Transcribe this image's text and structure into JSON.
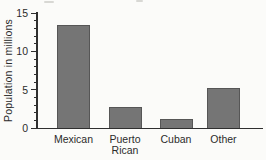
{
  "chart_data": {
    "type": "bar",
    "title": "",
    "categories": [
      "Mexican",
      "Puerto Rican",
      "Cuban",
      "Other"
    ],
    "values": [
      13.5,
      2.7,
      1.2,
      5.2
    ],
    "ylabel": "Population in millions",
    "xlabel": "",
    "ylim": [
      0,
      15
    ],
    "yticks": [
      0,
      5,
      10,
      15
    ],
    "minor_tick_step": 1,
    "grid": false,
    "legend": false,
    "colors": {
      "bar_fill": "#757575",
      "bar_border": "#565656",
      "axis": "#2f2f2f",
      "text": "#2b2b2b",
      "background": "#fbfbf9"
    }
  }
}
